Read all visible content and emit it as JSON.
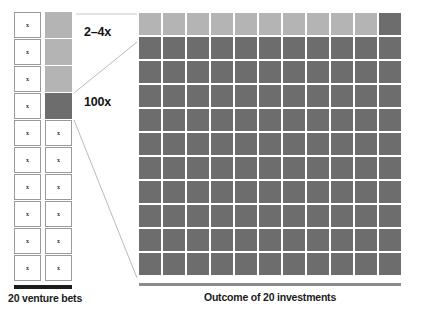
{
  "figure": {
    "type": "pictogram-diagram",
    "background_color": "#ffffff"
  },
  "palette": {
    "miss": "#ffffff",
    "miss_border": "#9a9a9a",
    "mid_return": "#b4b4b4",
    "high_return": "#6d6d6d",
    "text": "#1b1b1b",
    "left_rule": "#1b1b1b",
    "right_rule": "#8c8c8c",
    "callout_line": "#9a9a9a"
  },
  "left_panel": {
    "caption": "20 venture bets",
    "rows": 10,
    "columns": 2,
    "total_cells": 20,
    "cell_mark": "x",
    "legend": {
      "miss_count": 16,
      "mid_count": 3,
      "high_count": 1
    },
    "cells": [
      [
        "miss",
        "mid"
      ],
      [
        "miss",
        "mid"
      ],
      [
        "miss",
        "mid"
      ],
      [
        "miss",
        "high"
      ],
      [
        "miss",
        "miss"
      ],
      [
        "miss",
        "miss"
      ],
      [
        "miss",
        "miss"
      ],
      [
        "miss",
        "miss"
      ],
      [
        "miss",
        "miss"
      ],
      [
        "miss",
        "miss"
      ]
    ]
  },
  "labels": {
    "mid_multiplier": "2–4x",
    "high_multiplier": "100x"
  },
  "right_panel": {
    "caption": "Outcome of 20 investments",
    "rows": 11,
    "columns": 11,
    "total_cells": 121,
    "legend": {
      "mid_count": 10,
      "high_count": 111
    },
    "cells": [
      [
        "mid",
        "mid",
        "mid",
        "mid",
        "mid",
        "mid",
        "mid",
        "mid",
        "mid",
        "mid",
        "high"
      ],
      [
        "high",
        "high",
        "high",
        "high",
        "high",
        "high",
        "high",
        "high",
        "high",
        "high",
        "high"
      ],
      [
        "high",
        "high",
        "high",
        "high",
        "high",
        "high",
        "high",
        "high",
        "high",
        "high",
        "high"
      ],
      [
        "high",
        "high",
        "high",
        "high",
        "high",
        "high",
        "high",
        "high",
        "high",
        "high",
        "high"
      ],
      [
        "high",
        "high",
        "high",
        "high",
        "high",
        "high",
        "high",
        "high",
        "high",
        "high",
        "high"
      ],
      [
        "high",
        "high",
        "high",
        "high",
        "high",
        "high",
        "high",
        "high",
        "high",
        "high",
        "high"
      ],
      [
        "high",
        "high",
        "high",
        "high",
        "high",
        "high",
        "high",
        "high",
        "high",
        "high",
        "high"
      ],
      [
        "high",
        "high",
        "high",
        "high",
        "high",
        "high",
        "high",
        "high",
        "high",
        "high",
        "high"
      ],
      [
        "high",
        "high",
        "high",
        "high",
        "high",
        "high",
        "high",
        "high",
        "high",
        "high",
        "high"
      ],
      [
        "high",
        "high",
        "high",
        "high",
        "high",
        "high",
        "high",
        "high",
        "high",
        "high",
        "high"
      ],
      [
        "high",
        "high",
        "high",
        "high",
        "high",
        "high",
        "high",
        "high",
        "high",
        "high",
        "high"
      ]
    ]
  },
  "chart_data": {
    "type": "table",
    "series": [
      {
        "name": "20 venture bets",
        "categories": [
          "miss (x)",
          "2–4x return",
          "100x return"
        ],
        "values": [
          16,
          3,
          1
        ]
      },
      {
        "name": "Outcome of 20 investments",
        "categories": [
          "2–4x units",
          "100x units"
        ],
        "values": [
          10,
          111
        ]
      }
    ],
    "annotations": [
      "2–4x",
      "100x"
    ],
    "xlabel": "",
    "ylabel": ""
  }
}
